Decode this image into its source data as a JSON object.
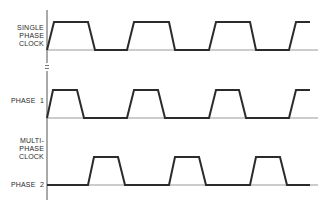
{
  "diagram": {
    "type": "timing-diagram",
    "colors": {
      "waveform": "#2b2b2b",
      "axis": "#555555",
      "baseline": "#999999",
      "label": "#2a2a2a"
    },
    "labels": {
      "single_phase": [
        "SINGLE",
        "PHASE",
        "CLOCK"
      ],
      "phase1": "PHASE  1",
      "multi_phase": [
        "MULTI-",
        "PHASE",
        "CLOCK"
      ],
      "phase2": "PHASE  2"
    },
    "signals": [
      {
        "name": "single-phase-clock",
        "high_y": 22,
        "low_y": 50,
        "points": [
          [
            47,
            50
          ],
          [
            54,
            22
          ],
          [
            88,
            22
          ],
          [
            95,
            50
          ],
          [
            127,
            50
          ],
          [
            134,
            22
          ],
          [
            169,
            22
          ],
          [
            175,
            50
          ],
          [
            209,
            50
          ],
          [
            216,
            22
          ],
          [
            250,
            22
          ],
          [
            256,
            50
          ],
          [
            289,
            50
          ],
          [
            296,
            22
          ],
          [
            310,
            22
          ]
        ]
      },
      {
        "name": "phase-1",
        "high_y": 90,
        "low_y": 118,
        "points": [
          [
            47,
            118
          ],
          [
            53,
            90
          ],
          [
            77,
            90
          ],
          [
            84,
            118
          ],
          [
            127,
            118
          ],
          [
            134,
            90
          ],
          [
            158,
            90
          ],
          [
            165,
            118
          ],
          [
            209,
            118
          ],
          [
            216,
            90
          ],
          [
            239,
            90
          ],
          [
            246,
            118
          ],
          [
            289,
            118
          ],
          [
            296,
            90
          ],
          [
            310,
            90
          ]
        ]
      },
      {
        "name": "phase-2",
        "high_y": 157,
        "low_y": 185,
        "points": [
          [
            47,
            185
          ],
          [
            88,
            185
          ],
          [
            94,
            157
          ],
          [
            118,
            157
          ],
          [
            125,
            185
          ],
          [
            169,
            185
          ],
          [
            175,
            157
          ],
          [
            199,
            157
          ],
          [
            206,
            185
          ],
          [
            250,
            185
          ],
          [
            256,
            157
          ],
          [
            280,
            157
          ],
          [
            287,
            185
          ],
          [
            310,
            185
          ]
        ]
      }
    ],
    "baselines": [
      50,
      118,
      185
    ],
    "axis": {
      "x": 47,
      "y_top": 10,
      "y_bottom": 200,
      "break_y": [
        64,
        70
      ]
    }
  }
}
